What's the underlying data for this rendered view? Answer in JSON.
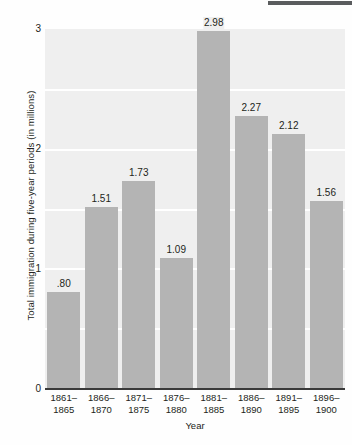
{
  "chart_data": {
    "type": "bar",
    "title": "",
    "xlabel": "Year",
    "ylabel": "Total immigration during five-year periods (in millions)",
    "categories": [
      "1861–1865",
      "1866–1870",
      "1871–1875",
      "1876–1880",
      "1881–1885",
      "1886–1890",
      "1891–1895",
      "1896–1900"
    ],
    "category_lines": [
      [
        "1861–",
        "1865"
      ],
      [
        "1866–",
        "1870"
      ],
      [
        "1871–",
        "1875"
      ],
      [
        "1876–",
        "1880"
      ],
      [
        "1881–",
        "1885"
      ],
      [
        "1886–",
        "1890"
      ],
      [
        "1891–",
        "1895"
      ],
      [
        "1896–",
        "1900"
      ]
    ],
    "values": [
      0.8,
      1.51,
      1.73,
      1.09,
      2.98,
      2.27,
      2.12,
      1.56
    ],
    "value_labels": [
      ".80",
      "1.51",
      "1.73",
      "1.09",
      "2.98",
      "2.27",
      "2.12",
      "1.56"
    ],
    "ylim": [
      0,
      3
    ],
    "yticks": [
      0,
      1,
      2,
      3
    ],
    "ytick_labels": [
      "0",
      "1",
      "2",
      "3"
    ],
    "gridlines_at": [
      0.5,
      1.0,
      1.5,
      2.0,
      2.5
    ],
    "grid": true,
    "legend": "none",
    "colors": {
      "bar": "#b4b4b4",
      "plot_background": "#efefef",
      "gridline": "#ffffff",
      "axis": "#3a3a3a",
      "text": "#231f20",
      "top_rule": "#5a5c5e"
    }
  },
  "axes": {
    "y_tick_0": "0",
    "y_tick_1": "1",
    "y_tick_2": "2",
    "y_tick_3": "3",
    "x_title": "Year",
    "y_title": "Total immigration during five-year periods (in millions)"
  }
}
